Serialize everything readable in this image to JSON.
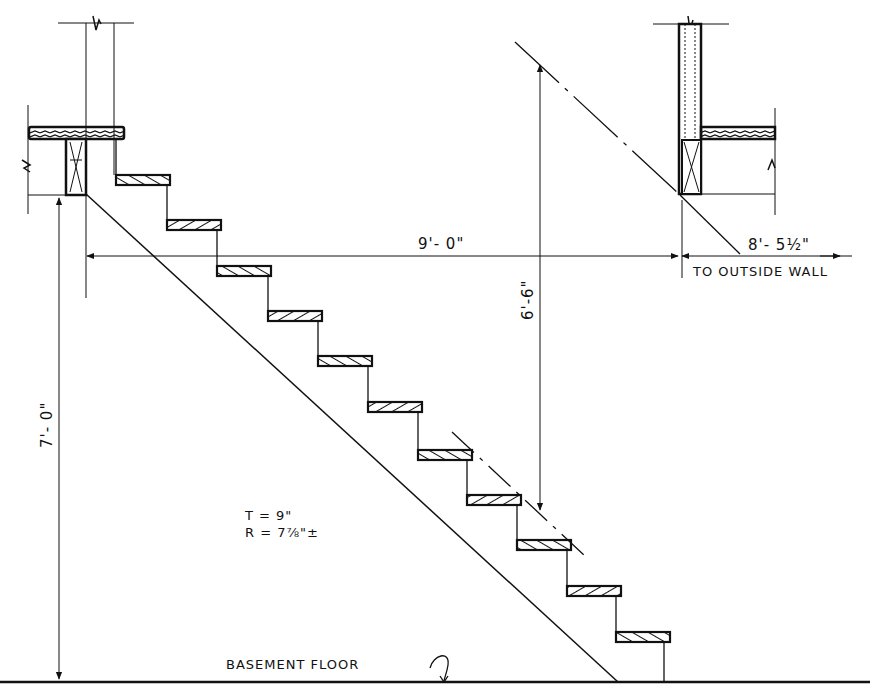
{
  "drawing": {
    "type": "stair-section",
    "dimensions": {
      "run_to_wall": "9'- 0\"",
      "to_outside_wall": "8'- 5½\"",
      "to_outside_wall_note": "TO OUTSIDE WALL",
      "headroom": "6'-6\"",
      "floor_to_floor": "7'- 0\""
    },
    "notes": {
      "tread": "T = 9\"",
      "riser": "R = 7⅞\"±",
      "floor_label": "BASEMENT FLOOR"
    },
    "treads_count": 11,
    "colors": {
      "line": "#111111",
      "background": "#ffffff"
    }
  }
}
